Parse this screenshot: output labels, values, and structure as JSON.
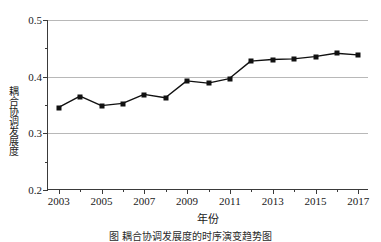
{
  "chart_data": {
    "type": "line",
    "title": "",
    "xlabel": "年份",
    "ylabel": "耦合协调发展度",
    "x": [
      2003,
      2004,
      2005,
      2006,
      2007,
      2008,
      2009,
      2010,
      2011,
      2012,
      2013,
      2014,
      2015,
      2016,
      2017
    ],
    "values": [
      0.345,
      0.365,
      0.348,
      0.352,
      0.368,
      0.362,
      0.392,
      0.388,
      0.396,
      0.427,
      0.43,
      0.431,
      0.435,
      0.441,
      0.438
    ],
    "series": [
      {
        "name": "耦合协调发展度",
        "values": [
          0.345,
          0.365,
          0.348,
          0.352,
          0.368,
          0.362,
          0.392,
          0.388,
          0.396,
          0.427,
          0.43,
          0.431,
          0.435,
          0.441,
          0.438
        ]
      }
    ],
    "xlim": [
      2002.5,
      2017.5
    ],
    "ylim": [
      0.2,
      0.5
    ],
    "ytick_values": [
      0.2,
      0.3,
      0.4,
      0.5
    ],
    "ytick_labels": [
      "0.2",
      "0.3",
      "0.4",
      "0.5"
    ],
    "ytick_minor_values": [
      0.25,
      0.35,
      0.45
    ],
    "xtick_values": [
      2003,
      2005,
      2007,
      2009,
      2011,
      2013,
      2015,
      2017
    ],
    "xtick_labels": [
      "2003",
      "2005",
      "2007",
      "2009",
      "2011",
      "2013",
      "2015",
      "2017"
    ],
    "xtick_minor_values": [
      2004,
      2006,
      2008,
      2010,
      2012,
      2014,
      2016
    ],
    "grid": true,
    "grid_axis": "y",
    "legend": false,
    "legend_position": "none",
    "marker": "square",
    "line_color": "#111111",
    "marker_color": "#111111",
    "grid_color": "#b8b8b8",
    "axis_color": "#3a3a3a"
  },
  "caption": {
    "text": "图      耦合协调发展度的时序演变趋势图"
  }
}
